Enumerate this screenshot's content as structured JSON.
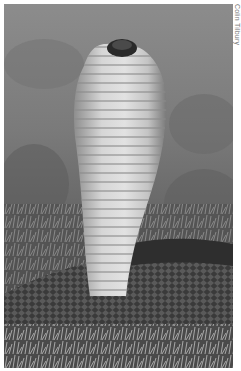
{
  "photo": {
    "subject": "cobra with raised hood",
    "alt": "Black-and-white photograph of a cobra rearing up with its hood spread, coiled in grass",
    "tone": "grayscale",
    "colors": {
      "background_sky": "#8a8a8a",
      "hood_light": "#d8d8d8",
      "hood_shadow": "#6a6a6a",
      "body_dark": "#2e2e2e",
      "grass": "#9a9a9a"
    }
  },
  "credit": {
    "text": "Colin Tilbury"
  }
}
